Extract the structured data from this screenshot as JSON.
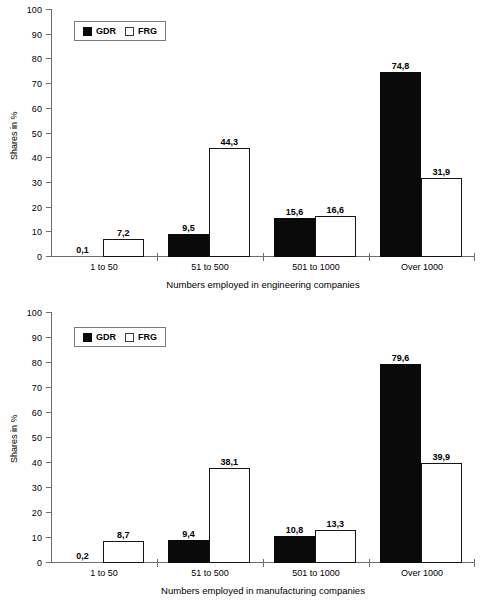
{
  "page": {
    "title": "Company size distribution GDR vs FRG",
    "background": "#ffffff",
    "text_color": "#000000"
  },
  "legend": {
    "gdr_label": "GDR",
    "frg_label": "FRG",
    "gdr_color": "#000000",
    "frg_color": "#ffffff",
    "position": "top-left-inside"
  },
  "y_axis": {
    "label": "Shares in %",
    "ticks": [
      "0",
      "10",
      "20",
      "30",
      "40",
      "50",
      "60",
      "70",
      "80",
      "90",
      "100"
    ]
  },
  "chart_data": [
    {
      "type": "bar",
      "id": "engineering",
      "title": "",
      "xlabel": "Numbers employed in engineering companies",
      "ylabel": "Shares in %",
      "ylim": [
        0,
        100
      ],
      "yticks": [
        0,
        10,
        20,
        30,
        40,
        50,
        60,
        70,
        80,
        90,
        100
      ],
      "grid": false,
      "legend_position": "upper left",
      "categories": [
        "1 to 50",
        "51 to 500",
        "501 to 1000",
        "Over 1000"
      ],
      "series": [
        {
          "name": "GDR",
          "color": "#000000",
          "values": [
            0.1,
            9.5,
            15.6,
            74.8
          ],
          "labels": [
            "0,1",
            "9,5",
            "15,6",
            "74,8"
          ]
        },
        {
          "name": "FRG",
          "color": "#ffffff",
          "values": [
            7.2,
            44.3,
            16.6,
            31.9
          ],
          "labels": [
            "7,2",
            "44,3",
            "16,6",
            "31,9"
          ]
        }
      ]
    },
    {
      "type": "bar",
      "id": "manufacturing",
      "title": "",
      "xlabel": "Numbers employed in manufacturing companies",
      "ylabel": "Shares in %",
      "ylim": [
        0,
        100
      ],
      "yticks": [
        0,
        10,
        20,
        30,
        40,
        50,
        60,
        70,
        80,
        90,
        100
      ],
      "grid": false,
      "legend_position": "upper left",
      "categories": [
        "1 to 50",
        "51 to 500",
        "501 to 1000",
        "Over 1000"
      ],
      "series": [
        {
          "name": "GDR",
          "color": "#000000",
          "values": [
            0.2,
            9.4,
            10.8,
            79.6
          ],
          "labels": [
            "0,2",
            "9,4",
            "10,8",
            "79,6"
          ]
        },
        {
          "name": "FRG",
          "color": "#ffffff",
          "values": [
            8.7,
            38.1,
            13.3,
            39.9
          ],
          "labels": [
            "8,7",
            "38,1",
            "13,3",
            "39,9"
          ]
        }
      ]
    }
  ]
}
